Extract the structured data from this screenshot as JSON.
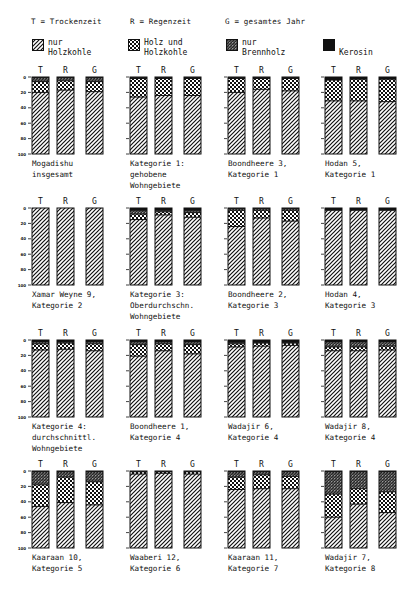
{
  "key": {
    "t": "T = Trockenzeit",
    "r": "R = Regenzeit",
    "g": "G = gesamtes Jahr"
  },
  "legend": [
    {
      "id": "hk",
      "label": "nur\nHolzkohle",
      "pattern": "diagonal-hatch"
    },
    {
      "id": "hhk",
      "label": "Holz und\nHolzkohle",
      "pattern": "checker"
    },
    {
      "id": "bh",
      "label": "nur\nBrennholz",
      "pattern": "dense-crosshatch"
    },
    {
      "id": "ker",
      "label": "\nKerosin",
      "pattern": "solid-black"
    }
  ],
  "bar_letters": [
    "T",
    "R",
    "G"
  ],
  "y_ticks": [
    "0",
    "20",
    "40",
    "60",
    "80",
    "100"
  ],
  "chart_data": {
    "type": "bar",
    "stacked": true,
    "unit": "percent of households",
    "ylim": [
      0,
      100
    ],
    "y_inverted": true,
    "categories": [
      "T",
      "R",
      "G"
    ],
    "series_order_top_to_bottom": [
      "Kerosin",
      "nur Brennholz",
      "Holz und Holzkohle",
      "nur Holzkohle"
    ],
    "panels": [
      {
        "label": "Mogadishu\ninsgesamt",
        "bars": [
          {
            "ker": 1,
            "bh": 5,
            "hhk": 14,
            "hk": 80
          },
          {
            "ker": 1,
            "bh": 4,
            "hhk": 12,
            "hk": 83
          },
          {
            "ker": 1,
            "bh": 5,
            "hhk": 13,
            "hk": 81
          }
        ]
      },
      {
        "label": "Kategorie 1:\ngehobene\nWohngebiete",
        "bars": [
          {
            "ker": 1,
            "bh": 1,
            "hhk": 24,
            "hk": 74
          },
          {
            "ker": 1,
            "bh": 1,
            "hhk": 22,
            "hk": 76
          },
          {
            "ker": 1,
            "bh": 1,
            "hhk": 22,
            "hk": 76
          }
        ]
      },
      {
        "label": "Boondheere 3,\nKategorie 1",
        "bars": [
          {
            "ker": 1,
            "bh": 1,
            "hhk": 18,
            "hk": 80
          },
          {
            "ker": 1,
            "bh": 1,
            "hhk": 14,
            "hk": 84
          },
          {
            "ker": 1,
            "bh": 1,
            "hhk": 16,
            "hk": 82
          }
        ]
      },
      {
        "label": "Hodan 5,\nKategorie 1",
        "bars": [
          {
            "ker": 4,
            "bh": 0,
            "hhk": 27,
            "hk": 69
          },
          {
            "ker": 3,
            "bh": 0,
            "hhk": 28,
            "hk": 69
          },
          {
            "ker": 3,
            "bh": 0,
            "hhk": 29,
            "hk": 68
          }
        ]
      },
      {
        "label": "Xamar Weyne 9,\nKategorie 2",
        "bars": [
          {
            "ker": 0,
            "bh": 0,
            "hhk": 0,
            "hk": 100
          },
          {
            "ker": 0,
            "bh": 0,
            "hhk": 0,
            "hk": 100
          },
          {
            "ker": 0,
            "bh": 0,
            "hhk": 0,
            "hk": 100
          }
        ]
      },
      {
        "label": "Kategorie 3:\nOberdurchschn.\nWohngebiete",
        "bars": [
          {
            "ker": 3,
            "bh": 5,
            "hhk": 7,
            "hk": 85
          },
          {
            "ker": 3,
            "bh": 2,
            "hhk": 4,
            "hk": 91
          },
          {
            "ker": 3,
            "bh": 3,
            "hhk": 6,
            "hk": 88
          }
        ]
      },
      {
        "label": "Boondheere 2,\nKategorie 3",
        "bars": [
          {
            "ker": 1,
            "bh": 2,
            "hhk": 21,
            "hk": 76
          },
          {
            "ker": 1,
            "bh": 2,
            "hhk": 10,
            "hk": 87
          },
          {
            "ker": 1,
            "bh": 2,
            "hhk": 14,
            "hk": 83
          }
        ]
      },
      {
        "label": "Hodan 4,\nKategorie 3",
        "bars": [
          {
            "ker": 3,
            "bh": 0,
            "hhk": 0,
            "hk": 97
          },
          {
            "ker": 3,
            "bh": 0,
            "hhk": 0,
            "hk": 97
          },
          {
            "ker": 3,
            "bh": 0,
            "hhk": 0,
            "hk": 97
          }
        ]
      },
      {
        "label": "Kategorie 4:\ndurchschnittl.\nWohngebiete",
        "bars": [
          {
            "ker": 2,
            "bh": 3,
            "hhk": 8,
            "hk": 87
          },
          {
            "ker": 2,
            "bh": 2,
            "hhk": 8,
            "hk": 88
          },
          {
            "ker": 2,
            "bh": 3,
            "hhk": 9,
            "hk": 86
          }
        ]
      },
      {
        "label": "Boondheere 1,\nKategorie 4",
        "bars": [
          {
            "ker": 2,
            "bh": 4,
            "hhk": 15,
            "hk": 79
          },
          {
            "ker": 2,
            "bh": 3,
            "hhk": 9,
            "hk": 86
          },
          {
            "ker": 2,
            "bh": 4,
            "hhk": 12,
            "hk": 82
          }
        ]
      },
      {
        "label": "Wadajir 6,\nKategorie 4",
        "bars": [
          {
            "ker": 3,
            "bh": 2,
            "hhk": 4,
            "hk": 91
          },
          {
            "ker": 3,
            "bh": 1,
            "hhk": 4,
            "hk": 92
          },
          {
            "ker": 3,
            "bh": 1,
            "hhk": 3,
            "hk": 93
          }
        ]
      },
      {
        "label": "Wadajir 8,\nKategorie 4",
        "bars": [
          {
            "ker": 2,
            "bh": 7,
            "hhk": 5,
            "hk": 86
          },
          {
            "ker": 2,
            "bh": 7,
            "hhk": 5,
            "hk": 86
          },
          {
            "ker": 2,
            "bh": 6,
            "hhk": 5,
            "hk": 87
          }
        ]
      },
      {
        "label": "Kaaraan 10,\nKategorie 5",
        "bars": [
          {
            "ker": 1,
            "bh": 17,
            "hhk": 28,
            "hk": 54
          },
          {
            "ker": 1,
            "bh": 7,
            "hhk": 33,
            "hk": 59
          },
          {
            "ker": 1,
            "bh": 13,
            "hhk": 30,
            "hk": 56
          }
        ]
      },
      {
        "label": "Waaberi 12,\nKategorie 6",
        "bars": [
          {
            "ker": 1,
            "bh": 0,
            "hhk": 3,
            "hk": 96
          },
          {
            "ker": 1,
            "bh": 0,
            "hhk": 2,
            "hk": 97
          },
          {
            "ker": 1,
            "bh": 0,
            "hhk": 3,
            "hk": 96
          }
        ]
      },
      {
        "label": "Kaaraan 11,\nKategorie 7",
        "bars": [
          {
            "ker": 1,
            "bh": 7,
            "hhk": 16,
            "hk": 76
          },
          {
            "ker": 1,
            "bh": 4,
            "hhk": 18,
            "hk": 77
          },
          {
            "ker": 1,
            "bh": 6,
            "hhk": 16,
            "hk": 77
          }
        ]
      },
      {
        "label": "Wadajir 7,\nKategorie 8",
        "bars": [
          {
            "ker": 1,
            "bh": 29,
            "hhk": 30,
            "hk": 40
          },
          {
            "ker": 1,
            "bh": 22,
            "hhk": 20,
            "hk": 57
          },
          {
            "ker": 1,
            "bh": 26,
            "hhk": 27,
            "hk": 46
          }
        ]
      }
    ]
  }
}
